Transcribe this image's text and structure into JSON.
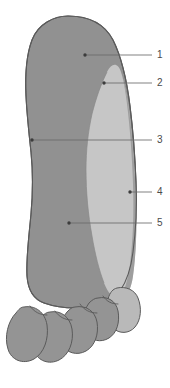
{
  "figure": {
    "kind": "anatomical-diagram",
    "view": "sole",
    "background_color": "#ffffff",
    "outline_color": "#5a5a5a",
    "leader_line_color": "#6b6b6b",
    "label_text_color": "#4a4a4a"
  },
  "regions": [
    {
      "id": "region-medial-plantar",
      "name": "medial-plantar-region",
      "fill": "#919191",
      "shade": "dark-gray"
    },
    {
      "id": "region-lateral-band",
      "name": "lateral-plantar-band",
      "fill": "#c6c6c6",
      "shade": "light-gray"
    },
    {
      "id": "region-lateral-border",
      "name": "lateral-border-strip",
      "fill": "#9a9a9a",
      "shade": "mid-gray"
    },
    {
      "id": "region-toes",
      "name": "toes-group",
      "fill": "#919191",
      "shade": "dark-gray"
    },
    {
      "id": "region-fifth-toe",
      "name": "fifth-toe",
      "fill": "#b8b8b8",
      "shade": "light-gray"
    }
  ],
  "callouts": [
    {
      "number": "1",
      "dot": {
        "x": 85,
        "y": 55
      },
      "elbow": {
        "x": 85,
        "y": 55
      },
      "end": {
        "x": 152,
        "y": 55
      },
      "label": {
        "x": 157,
        "y": 50
      }
    },
    {
      "number": "2",
      "dot": {
        "x": 104,
        "y": 83
      },
      "elbow": {
        "x": 104,
        "y": 83
      },
      "end": {
        "x": 152,
        "y": 83
      },
      "label": {
        "x": 157,
        "y": 78
      }
    },
    {
      "number": "3",
      "dot": {
        "x": 32,
        "y": 140
      },
      "elbow": {
        "x": 32,
        "y": 140
      },
      "end": {
        "x": 152,
        "y": 140
      },
      "label": {
        "x": 157,
        "y": 135
      }
    },
    {
      "number": "4",
      "dot": {
        "x": 130,
        "y": 192
      },
      "elbow": {
        "x": 130,
        "y": 192
      },
      "end": {
        "x": 152,
        "y": 192
      },
      "label": {
        "x": 157,
        "y": 187
      }
    },
    {
      "number": "5",
      "dot": {
        "x": 69,
        "y": 223
      },
      "elbow": {
        "x": 69,
        "y": 223
      },
      "end": {
        "x": 152,
        "y": 223
      },
      "label": {
        "x": 157,
        "y": 218
      }
    }
  ],
  "labels": {
    "one": "1",
    "two": "2",
    "three": "3",
    "four": "4",
    "five": "5"
  }
}
